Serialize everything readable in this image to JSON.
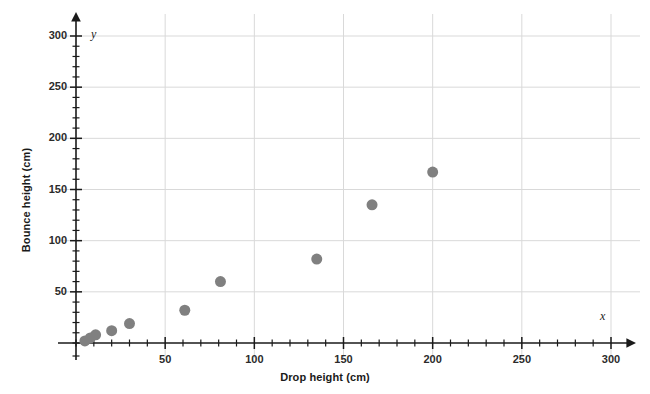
{
  "chart_data": {
    "type": "scatter",
    "title": "",
    "xlabel": "Drop height (cm)",
    "ylabel": "Bounce height (cm)",
    "x_var_label": "x",
    "y_var_label": "y",
    "xlim": [
      0,
      300
    ],
    "ylim": [
      0,
      300
    ],
    "x_ticks": [
      50,
      100,
      150,
      200,
      250,
      300
    ],
    "y_ticks": [
      50,
      100,
      150,
      200,
      250,
      300
    ],
    "x_tick_labels": [
      "50",
      "100",
      "150",
      "200",
      "250",
      "300"
    ],
    "y_tick_labels": [
      "50",
      "100",
      "150",
      "200",
      "250",
      "300"
    ],
    "minor_tick_interval": 10,
    "grid": true,
    "grid_interval": 50,
    "legend": "none",
    "marker_color": "#808080",
    "marker_size": 11,
    "axis_color": "#1a1a1a",
    "grid_color": "#d9d9d9",
    "points": [
      {
        "x": 5,
        "y": 2
      },
      {
        "x": 8,
        "y": 5
      },
      {
        "x": 11,
        "y": 8
      },
      {
        "x": 20,
        "y": 12
      },
      {
        "x": 30,
        "y": 19
      },
      {
        "x": 61,
        "y": 32
      },
      {
        "x": 81,
        "y": 60
      },
      {
        "x": 135,
        "y": 82
      },
      {
        "x": 166,
        "y": 135
      },
      {
        "x": 200,
        "y": 167
      }
    ]
  }
}
